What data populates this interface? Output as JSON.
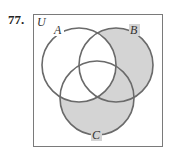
{
  "problem": {
    "number": "77."
  },
  "diagram": {
    "universe_label": "U",
    "sets": [
      {
        "label": "A",
        "cx": 79,
        "cy": 65,
        "r": 37
      },
      {
        "label": "B",
        "cx": 116,
        "cy": 65,
        "r": 37
      },
      {
        "label": "C",
        "cx": 97,
        "cy": 98,
        "r": 37
      }
    ],
    "shaded_region": "(B ∪ C) − A",
    "colors": {
      "shade": "#d4d4d4",
      "stroke": "#6a6a6a",
      "box": "#7a7a7a"
    }
  }
}
